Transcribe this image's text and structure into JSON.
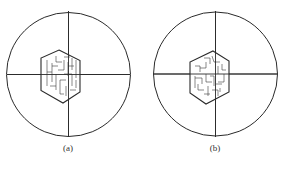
{
  "figure": {
    "panels": [
      {
        "id": "a",
        "caption": "(a)",
        "circle": {
          "cx": 68.5,
          "cy": 74.5,
          "r": 62
        },
        "hexagon": "59,50 80,60.5 80,92 63,103 41,90.5 41,58",
        "maze_paths": [
          "M47,60 L47,86 M47,72 L52,72 M52,63 L52,82 M52,66 L58,66 M56,56 L56,62 L62,62 M58,70 L64,70 L64,60 M64,57 L70,57 M68,62 L68,76 M68,66 L74,66 M72,58 L72,70 M76,60 L76,78 M56,74 L56,90 M60,80 L60,94 M60,80 L66,80 M64,74 L72,74 L72,86 M66,86 L66,96 M70,90 L76,90 M76,80 L76,88 M50,86 L56,86 M60,94 L64,94"
        ],
        "crosshair": {
          "h": [
            7,
            130
          ],
          "v": [
            11,
            137
          ]
        }
      },
      {
        "id": "b",
        "caption": "(b)",
        "circle": {
          "cx": 215.5,
          "cy": 74,
          "r": 62
        },
        "hexagon": "213,51 229,61 229,92 206,104 190,93 190,62",
        "maze_paths": [
          "M195,66 L200,66 L200,72 M200,68 L206,68 L206,62 M204,58 L210,58 L210,64 M212,56 L214,62 L220,62 M218,66 L218,74 M222,64 L222,70 L226,70 M224,74 L224,82 L218,82 M195,76 L195,88 M195,78 L202,78 L202,84 M198,84 L198,90 L204,90 M206,74 L206,82 L212,82 M210,76 L214,76 L214,86 M208,86 L208,96 M212,90 L218,90 L218,96 M216,84 L222,84 M204,94 L210,94 M220,88 L220,92"
        ],
        "crosshair": {
          "h": [
            154,
            277
          ],
          "v": [
            11,
            137
          ]
        }
      }
    ],
    "stroke_color": "#2a2a2a"
  }
}
